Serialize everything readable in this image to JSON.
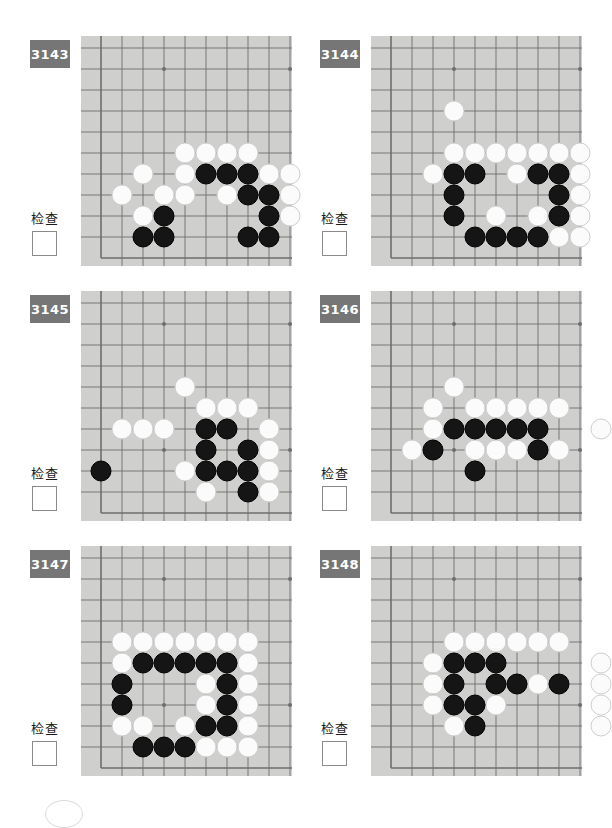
{
  "page": {
    "background_color": "#ffffff",
    "badge_color": "#767676",
    "board_color": "#cfcfcd",
    "line_color": "#6e6e6e",
    "black_stone_color": "#151515",
    "white_stone_color": "#fbfbfb"
  },
  "board": {
    "columns": 10,
    "rows": 11,
    "cell_size": 21,
    "origin_x": 20,
    "origin_y": 12,
    "star_points": [
      [
        3,
        1
      ],
      [
        9,
        1
      ],
      [
        3,
        7
      ],
      [
        9,
        7
      ]
    ],
    "edge_left_col": 0,
    "edge_bottom_row": 10
  },
  "labels": {
    "check": "检查",
    "checkbox_value": ""
  },
  "problems": [
    {
      "id": "3143",
      "check_label": "检查",
      "stones": {
        "white": [
          [
            4,
            5
          ],
          [
            5,
            5
          ],
          [
            6,
            5
          ],
          [
            7,
            5
          ],
          [
            2,
            6
          ],
          [
            4,
            6
          ],
          [
            8,
            6
          ],
          [
            9,
            6
          ],
          [
            1,
            7
          ],
          [
            3,
            7
          ],
          [
            4,
            7
          ],
          [
            6,
            7
          ],
          [
            9,
            7
          ],
          [
            2,
            8
          ],
          [
            9,
            8
          ]
        ],
        "black": [
          [
            5,
            6
          ],
          [
            6,
            6
          ],
          [
            7,
            6
          ],
          [
            7,
            7
          ],
          [
            8,
            7
          ],
          [
            3,
            8
          ],
          [
            8,
            8
          ],
          [
            2,
            9
          ],
          [
            3,
            9
          ],
          [
            7,
            9
          ],
          [
            8,
            9
          ]
        ]
      }
    },
    {
      "id": "3144",
      "check_label": "检查",
      "stones": {
        "white": [
          [
            3,
            3
          ],
          [
            3,
            5
          ],
          [
            4,
            5
          ],
          [
            5,
            5
          ],
          [
            6,
            5
          ],
          [
            7,
            5
          ],
          [
            8,
            5
          ],
          [
            9,
            5
          ],
          [
            2,
            6
          ],
          [
            6,
            6
          ],
          [
            9,
            6
          ],
          [
            9,
            7
          ],
          [
            5,
            8
          ],
          [
            7,
            8
          ],
          [
            9,
            8
          ],
          [
            8,
            9
          ],
          [
            9,
            9
          ]
        ],
        "black": [
          [
            3,
            6
          ],
          [
            4,
            6
          ],
          [
            7,
            6
          ],
          [
            8,
            6
          ],
          [
            3,
            7
          ],
          [
            8,
            7
          ],
          [
            3,
            8
          ],
          [
            8,
            8
          ],
          [
            4,
            9
          ],
          [
            5,
            9
          ],
          [
            6,
            9
          ],
          [
            7,
            9
          ]
        ]
      }
    },
    {
      "id": "3145",
      "check_label": "检查",
      "stones": {
        "white": [
          [
            4,
            4
          ],
          [
            5,
            5
          ],
          [
            6,
            5
          ],
          [
            7,
            5
          ],
          [
            1,
            6
          ],
          [
            2,
            6
          ],
          [
            3,
            6
          ],
          [
            8,
            6
          ],
          [
            8,
            7
          ],
          [
            4,
            8
          ],
          [
            8,
            8
          ],
          [
            5,
            9
          ],
          [
            8,
            9
          ]
        ],
        "black": [
          [
            5,
            6
          ],
          [
            6,
            6
          ],
          [
            5,
            7
          ],
          [
            7,
            7
          ],
          [
            0,
            8
          ],
          [
            5,
            8
          ],
          [
            6,
            8
          ],
          [
            7,
            8
          ],
          [
            7,
            9
          ]
        ]
      }
    },
    {
      "id": "3146",
      "check_label": "检查",
      "stones": {
        "white": [
          [
            3,
            4
          ],
          [
            2,
            5
          ],
          [
            4,
            5
          ],
          [
            5,
            5
          ],
          [
            6,
            5
          ],
          [
            7,
            5
          ],
          [
            8,
            5
          ],
          [
            2,
            6
          ],
          [
            10,
            6
          ],
          [
            1,
            7
          ],
          [
            4,
            7
          ],
          [
            5,
            7
          ],
          [
            6,
            7
          ],
          [
            8,
            7
          ]
        ],
        "black": [
          [
            3,
            6
          ],
          [
            4,
            6
          ],
          [
            5,
            6
          ],
          [
            6,
            6
          ],
          [
            7,
            6
          ],
          [
            2,
            7
          ],
          [
            7,
            7
          ],
          [
            4,
            8
          ]
        ]
      }
    },
    {
      "id": "3147",
      "check_label": "检查",
      "stones": {
        "white": [
          [
            1,
            4
          ],
          [
            2,
            4
          ],
          [
            3,
            4
          ],
          [
            4,
            4
          ],
          [
            5,
            4
          ],
          [
            6,
            4
          ],
          [
            7,
            4
          ],
          [
            1,
            5
          ],
          [
            7,
            5
          ],
          [
            5,
            6
          ],
          [
            7,
            6
          ],
          [
            5,
            7
          ],
          [
            7,
            7
          ],
          [
            1,
            8
          ],
          [
            2,
            8
          ],
          [
            4,
            8
          ],
          [
            7,
            8
          ],
          [
            5,
            9
          ],
          [
            6,
            9
          ],
          [
            7,
            9
          ]
        ],
        "black": [
          [
            2,
            5
          ],
          [
            3,
            5
          ],
          [
            4,
            5
          ],
          [
            5,
            5
          ],
          [
            6,
            5
          ],
          [
            1,
            6
          ],
          [
            6,
            6
          ],
          [
            1,
            7
          ],
          [
            6,
            7
          ],
          [
            5,
            8
          ],
          [
            6,
            8
          ],
          [
            2,
            9
          ],
          [
            3,
            9
          ],
          [
            4,
            9
          ]
        ]
      }
    },
    {
      "id": "3148",
      "check_label": "检查",
      "stones": {
        "white": [
          [
            3,
            4
          ],
          [
            4,
            4
          ],
          [
            5,
            4
          ],
          [
            6,
            4
          ],
          [
            7,
            4
          ],
          [
            8,
            4
          ],
          [
            2,
            5
          ],
          [
            10,
            5
          ],
          [
            2,
            6
          ],
          [
            7,
            6
          ],
          [
            10,
            6
          ],
          [
            2,
            7
          ],
          [
            5,
            7
          ],
          [
            10,
            7
          ],
          [
            3,
            8
          ],
          [
            10,
            8
          ]
        ],
        "black": [
          [
            3,
            5
          ],
          [
            4,
            5
          ],
          [
            5,
            5
          ],
          [
            3,
            6
          ],
          [
            5,
            6
          ],
          [
            6,
            6
          ],
          [
            8,
            6
          ],
          [
            3,
            7
          ],
          [
            4,
            7
          ],
          [
            4,
            8
          ]
        ]
      }
    }
  ],
  "artifact": {
    "name": "partial-circle-mark"
  }
}
